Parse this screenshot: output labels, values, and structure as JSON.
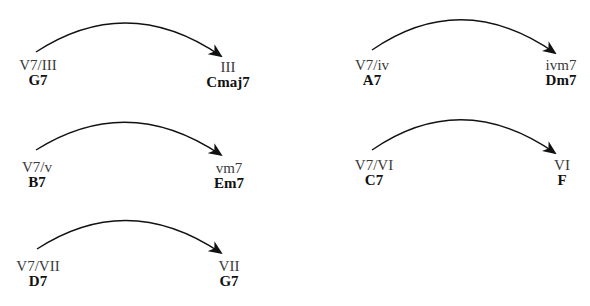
{
  "diagram": {
    "type": "secondary-dominant-resolutions",
    "arrow_color": "#111111",
    "resolutions": [
      {
        "id": "v7-of-III",
        "from": {
          "numeral": "V7/III",
          "chord": "G7"
        },
        "to": {
          "numeral": "III",
          "chord": "Cmaj7"
        }
      },
      {
        "id": "v7-of-iv",
        "from": {
          "numeral": "V7/iv",
          "chord": "A7"
        },
        "to": {
          "numeral": "ivm7",
          "chord": "Dm7"
        }
      },
      {
        "id": "v7-of-v",
        "from": {
          "numeral": "V7/v",
          "chord": "B7"
        },
        "to": {
          "numeral": "vm7",
          "chord": "Em7"
        }
      },
      {
        "id": "v7-of-VI",
        "from": {
          "numeral": "V7/VI",
          "chord": "C7"
        },
        "to": {
          "numeral": "VI",
          "chord": "F"
        }
      },
      {
        "id": "v7-of-VII",
        "from": {
          "numeral": "V7/VII",
          "chord": "D7"
        },
        "to": {
          "numeral": "VII",
          "chord": "G7"
        }
      }
    ]
  }
}
